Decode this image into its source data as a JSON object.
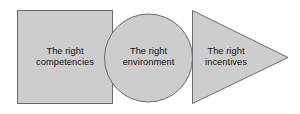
{
  "diagram": {
    "type": "process-shapes",
    "background_color": "#ffffff",
    "shape_fill_color": "#cdcdcd",
    "shape_stroke_color": "#6b6b6b",
    "text_color": "#111111",
    "shapes": [
      {
        "id": "competencies",
        "shape": "square",
        "label": "The right\ncompetencies",
        "line1": "The right",
        "line2": "competencies"
      },
      {
        "id": "environment",
        "shape": "circle",
        "label": "The right\nenvironment",
        "line1": "The right",
        "line2": "environment"
      },
      {
        "id": "incentives",
        "shape": "triangle-right",
        "label": "The right\nincentives",
        "line1": "The right",
        "line2": "incentives"
      }
    ]
  }
}
